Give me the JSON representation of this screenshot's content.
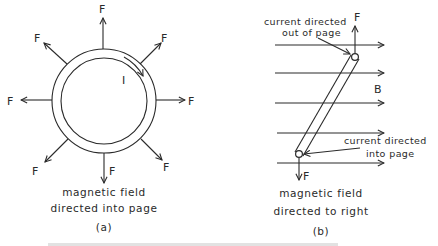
{
  "figure": {
    "panel_a": {
      "force_label": "F",
      "current_label": "I",
      "caption_line1": "magnetic field",
      "caption_line2": "directed into page",
      "panel_label": "(a)",
      "force_directions": [
        "N",
        "NE",
        "E",
        "SE",
        "S",
        "SW",
        "W",
        "NW"
      ]
    },
    "panel_b": {
      "top_current_line1": "current directed",
      "top_current_line2": "out of page",
      "bottom_current_line1": "current directed",
      "bottom_current_line2": "into page",
      "force_label_top": "F",
      "force_label_bottom": "F",
      "field_label": "B",
      "caption_line1": "magnetic field",
      "caption_line2": "directed to right",
      "panel_label": "(b)",
      "field_line_count": 5
    },
    "colors": {
      "ink": "#2a2a2a",
      "background": "#ffffff"
    }
  }
}
